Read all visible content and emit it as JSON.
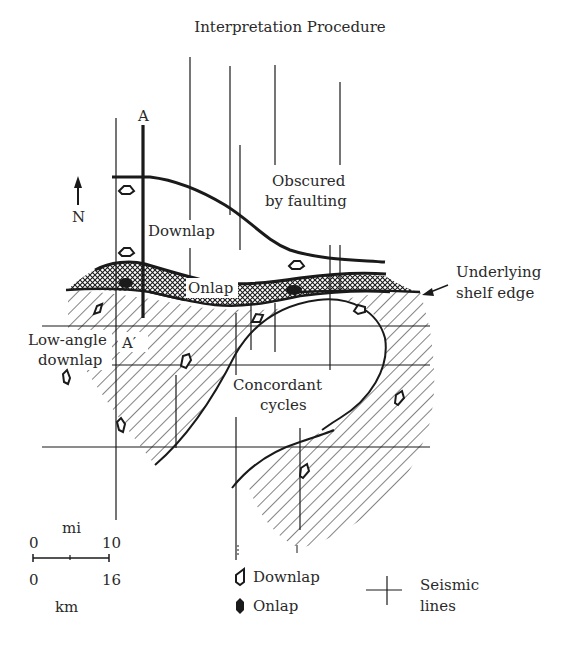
{
  "title": "Interpretation Procedure",
  "section_line": {
    "start_label": "A",
    "end_label": "A′"
  },
  "north_arrow": {
    "label": "N",
    "icon": "north-arrow-icon"
  },
  "regions": {
    "downlap_upper": "Downlap",
    "obscured_line1": "Obscured",
    "obscured_line2": "by faulting",
    "onlap": "Onlap",
    "shelf_line1": "Underlying",
    "shelf_line2": "shelf edge",
    "low_angle_line1": "Low-angle",
    "low_angle_line2": "downlap",
    "concordant_line1": "Concordant",
    "concordant_line2": "cycles"
  },
  "scale_bar": {
    "unit_top": "mi",
    "top_start": "0",
    "top_end": "10",
    "bottom_start": "0",
    "bottom_end": "16",
    "unit_bottom": "km"
  },
  "legend": {
    "downlap": {
      "label": "Downlap",
      "icon": "downlap-symbol-icon"
    },
    "onlap": {
      "label": "Onlap",
      "icon": "onlap-symbol-icon"
    },
    "seismic_line1": "Seismic",
    "seismic_line2": "lines"
  },
  "colors": {
    "ink": "#1a1a1a",
    "paper": "#ffffff",
    "text": "#2a2a2a"
  }
}
